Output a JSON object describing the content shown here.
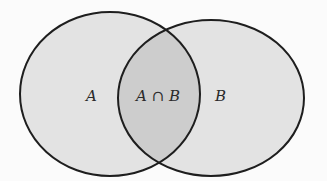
{
  "diagram": {
    "type": "venn",
    "sets": [
      {
        "id": "A",
        "label": "A",
        "fill": "#e3e3e3"
      },
      {
        "id": "B",
        "label": "B",
        "fill": "#e3e3e3"
      }
    ],
    "intersection": {
      "label": "A ∩ B",
      "fill": "#cdcdcd"
    },
    "stroke_color": "#1e1e1e",
    "background": "#fbfbfb"
  }
}
